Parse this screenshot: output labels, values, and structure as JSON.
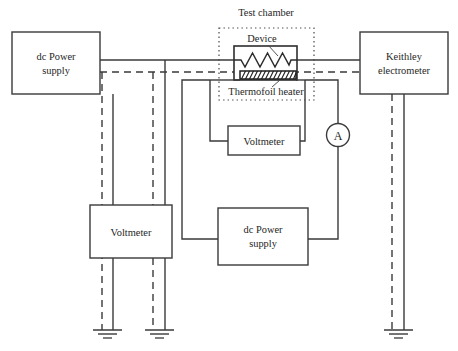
{
  "figure": {
    "title": "Test chamber",
    "type": "electrical-schematic"
  },
  "colors": {
    "background": "#ffffff",
    "wire": "#3a3a3a",
    "box_stroke": "#3a3a3a",
    "text": "#262626",
    "chamber_stroke": "#4a4a4a",
    "device_stroke": "#2d2d2d",
    "heater_stroke": "#1f1f1f"
  },
  "blocks": [
    {
      "id": "dc-power-supply-left",
      "label_line1": "dc Power",
      "label_line2": "supply"
    },
    {
      "id": "keithley-electrometer",
      "label_line1": "Keithley",
      "label_line2": "electrometer"
    },
    {
      "id": "voltmeter-upper",
      "label_line1": "Voltmeter",
      "label_line2": ""
    },
    {
      "id": "voltmeter-left",
      "label_line1": "Voltmeter",
      "label_line2": ""
    },
    {
      "id": "dc-power-supply-lower",
      "label_line1": "dc Power",
      "label_line2": "supply"
    }
  ],
  "annotations": {
    "chamber_title": "Test chamber",
    "device": "Device",
    "heater": "Thermofoil heater",
    "ammeter": "A"
  },
  "ground_symbols": {
    "count": 3
  }
}
